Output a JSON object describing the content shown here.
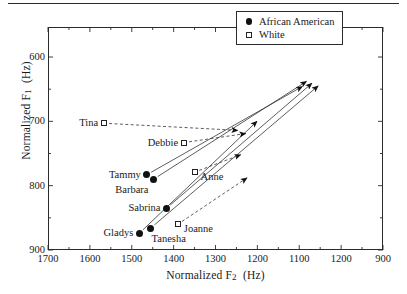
{
  "figure": {
    "top_rule": true
  },
  "axes": {
    "x": {
      "label": "Normalized F2  (Hz)",
      "label_main": "Normalized F",
      "label_sub": "2",
      "label_unit": "(Hz)",
      "ticks": [
        "1700",
        "1600",
        "1500",
        "1400",
        "1300",
        "1200",
        "1100",
        "1200",
        "900"
      ],
      "range": [
        1700,
        900
      ],
      "reversed": true
    },
    "y": {
      "label": "Normalized F1  (Hz)",
      "label_main": "Normalized F",
      "label_sub": "1",
      "label_unit": "(Hz)",
      "ticks": [
        "600",
        "700",
        "800",
        "900"
      ],
      "range": [
        600,
        900
      ],
      "inverted": true
    }
  },
  "legend": {
    "entries": [
      {
        "label": "African American",
        "marker": "filled-circle",
        "color": "#111111"
      },
      {
        "label": "White",
        "marker": "open-square",
        "color": "#222222"
      }
    ]
  },
  "chart_data": {
    "type": "scatter",
    "title": "",
    "xlabel": "Normalized F2 (Hz)",
    "ylabel": "Normalized F1 (Hz)",
    "xlim": [
      1700,
      900
    ],
    "ylim": [
      900,
      600
    ],
    "x_reversed": true,
    "y_inverted": true,
    "grid": false,
    "legend_position": "top-right",
    "series": [
      {
        "name": "African American",
        "marker": "filled-circle",
        "line_style": "solid",
        "points": [
          {
            "label": "Tammy",
            "x": 1464,
            "y": 783,
            "arrow_x": 1093,
            "arrow_y": 646,
            "label_pos": "left"
          },
          {
            "label": "Barbara",
            "x": 1448,
            "y": 790,
            "arrow_x": 1083,
            "arrow_y": 638,
            "label_pos": "below-left"
          },
          {
            "label": "Sabrina",
            "x": 1417,
            "y": 835,
            "arrow_x": 1070,
            "arrow_y": 641,
            "label_pos": "left"
          },
          {
            "label": "Gladys",
            "x": 1482,
            "y": 874,
            "arrow_x": 1201,
            "arrow_y": 700,
            "label_pos": "left"
          },
          {
            "label": "Tanesha",
            "x": 1455,
            "y": 866,
            "arrow_x": 1055,
            "arrow_y": 645,
            "label_pos": "below-right"
          }
        ]
      },
      {
        "name": "White",
        "marker": "open-square",
        "line_style": "dashed",
        "points": [
          {
            "label": "Tina",
            "x": 1566,
            "y": 703,
            "arrow_x": 1247,
            "arrow_y": 714,
            "label_pos": "left"
          },
          {
            "label": "Debbie",
            "x": 1375,
            "y": 733,
            "arrow_x": 1228,
            "arrow_y": 719,
            "label_pos": "left"
          },
          {
            "label": "Anne",
            "x": 1350,
            "y": 779,
            "arrow_x": 1240,
            "arrow_y": 752,
            "label_pos": "right"
          },
          {
            "label": "Joanne",
            "x": 1390,
            "y": 860,
            "arrow_x": 1225,
            "arrow_y": 788,
            "label_pos": "right"
          }
        ]
      }
    ]
  }
}
